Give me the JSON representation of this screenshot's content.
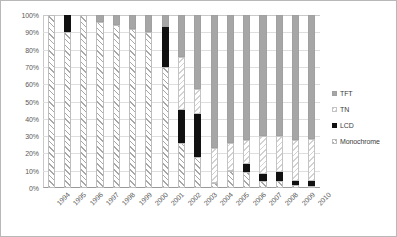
{
  "chart_data": {
    "type": "bar",
    "subtype": "100% stacked column",
    "title": "",
    "xlabel": "",
    "ylabel": "",
    "ylim": [
      0,
      100
    ],
    "yticks": [
      "0%",
      "10%",
      "20%",
      "30%",
      "40%",
      "50%",
      "60%",
      "70%",
      "80%",
      "90%",
      "100%"
    ],
    "ytick_values": [
      0,
      10,
      20,
      30,
      40,
      50,
      60,
      70,
      80,
      90,
      100
    ],
    "grid": true,
    "legend_position": "right",
    "categories": [
      "1994",
      "1995",
      "1996",
      "1997",
      "1998",
      "1999",
      "2000",
      "2001",
      "2002",
      "2003",
      "2004",
      "2005",
      "2006",
      "2007",
      "2008",
      "2009",
      "2010"
    ],
    "series": [
      {
        "name": "Monochrome",
        "color": "#ffffff",
        "pattern": "diagonal-hatch",
        "values": [
          100,
          90,
          100,
          96,
          94,
          92,
          90,
          70,
          26,
          18,
          3,
          10,
          9,
          4,
          4,
          2,
          1
        ]
      },
      {
        "name": "LCD",
        "color": "#111111",
        "pattern": "solid-black",
        "values": [
          0,
          10,
          0,
          0,
          0,
          0,
          0,
          23,
          19,
          25,
          0,
          0,
          5,
          4,
          5,
          2,
          3
        ]
      },
      {
        "name": "TN",
        "color": "#ffffff",
        "pattern": "reverse-hatch",
        "values": [
          0,
          0,
          0,
          0,
          0,
          0,
          0,
          0,
          31,
          14,
          20,
          16,
          14,
          22,
          21,
          24,
          24
        ]
      },
      {
        "name": "TFT",
        "color": "#a6a6a6",
        "pattern": "solid-gray",
        "values": [
          0,
          0,
          0,
          4,
          6,
          8,
          10,
          7,
          24,
          43,
          77,
          74,
          72,
          70,
          70,
          72,
          72
        ]
      }
    ],
    "legend_entries": [
      {
        "label": "TFT",
        "key": "k-tft"
      },
      {
        "label": "TN",
        "key": "k-tn"
      },
      {
        "label": "LCD",
        "key": "k-lcd"
      },
      {
        "label": "Monochrome",
        "key": "k-mono"
      }
    ]
  }
}
